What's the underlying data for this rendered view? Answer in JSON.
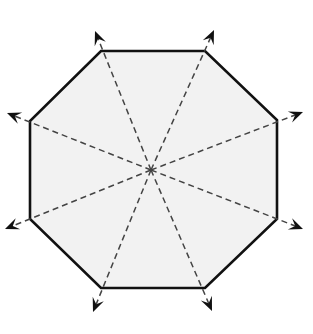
{
  "diagram": {
    "shape": "octagon",
    "fill_color": "#f2f2f2",
    "stroke_color": "#111111",
    "dash_color": "#444444",
    "center": [
      151,
      170
    ],
    "vertices": [
      [
        101,
        51
      ],
      [
        205,
        51
      ],
      [
        277,
        120
      ],
      [
        277,
        219
      ],
      [
        205,
        288
      ],
      [
        101,
        288
      ],
      [
        30,
        219
      ],
      [
        30,
        121
      ]
    ],
    "arrow_tips": [
      [
        95,
        31
      ],
      [
        214,
        30
      ],
      [
        303,
        112
      ],
      [
        303,
        229
      ],
      [
        212,
        311
      ],
      [
        93,
        312
      ],
      [
        5,
        229
      ],
      [
        7,
        113
      ]
    ],
    "arrow_count": 8
  }
}
